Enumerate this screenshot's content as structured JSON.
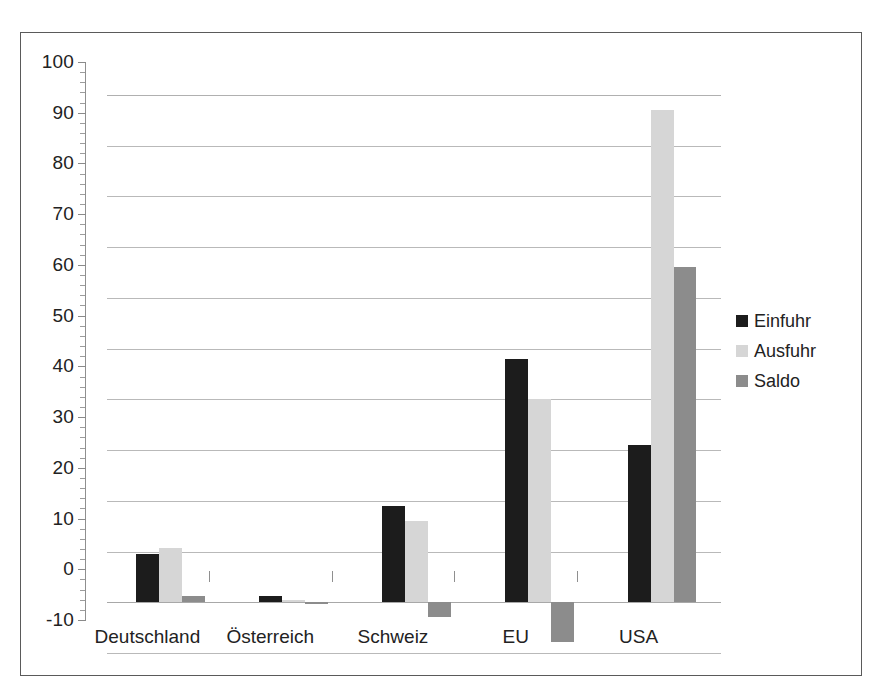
{
  "chart_data": {
    "type": "bar",
    "title": "",
    "subtitle": "",
    "xlabel": "",
    "ylabel": "",
    "categories": [
      "Deutschland",
      "Österreich",
      "Schweiz",
      "EU",
      "USA"
    ],
    "series": [
      {
        "name": "Einfuhr",
        "color": "#1c1c1c",
        "values": [
          9.5,
          1.2,
          19.0,
          48.0,
          31.0
        ]
      },
      {
        "name": "Ausfuhr",
        "color": "#d6d6d6",
        "values": [
          10.7,
          0.4,
          16.0,
          40.0,
          97.0
        ]
      },
      {
        "name": "Saldo",
        "color": "#8c8c8c",
        "values": [
          1.2,
          -0.4,
          -3.0,
          -7.8,
          66.0
        ]
      }
    ],
    "ylim": [
      -10,
      100
    ],
    "ytick_values": [
      -10,
      0,
      10,
      20,
      30,
      40,
      50,
      60,
      70,
      80,
      90,
      100
    ],
    "ytick_labels": [
      "-10",
      "0",
      "10",
      "20",
      "30",
      "40",
      "50",
      "60",
      "70",
      "80",
      "90",
      "100"
    ],
    "ytick_step": 10,
    "yminor_per_major": 5,
    "grid": true,
    "grid_axis": "y",
    "legend_position": "right",
    "legend_entries": [
      "Einfuhr",
      "Ausfuhr",
      "Saldo"
    ],
    "annotations": [],
    "frame": true
  }
}
